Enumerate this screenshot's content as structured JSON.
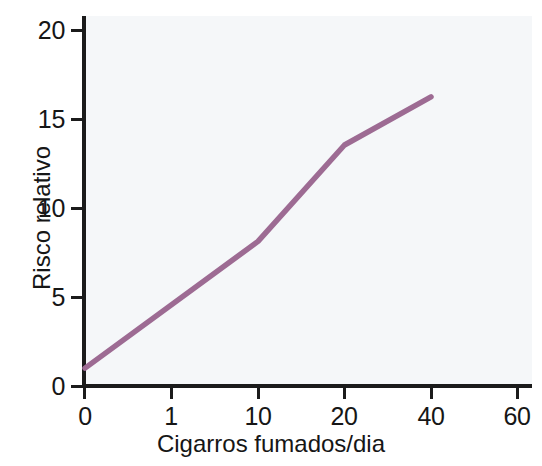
{
  "chart_data": {
    "type": "line",
    "title": "",
    "xlabel": "Cigarros fumados/dia",
    "ylabel": "Risco relativo",
    "x_tick_labels": [
      "0",
      "1",
      "10",
      "20",
      "40",
      "60"
    ],
    "y_tick_labels": [
      "0",
      "5",
      "10",
      "15",
      "20"
    ],
    "y_ticks": [
      0,
      5,
      10,
      15,
      20
    ],
    "ylim": [
      0,
      21.3
    ],
    "grid": false,
    "legend": null,
    "x_axis_scale": "categorical-evenly-spaced",
    "series": [
      {
        "name": "Risco relativo",
        "color": "#9d6b93",
        "x_categories": [
          "0",
          "10",
          "20",
          "40"
        ],
        "x_values": [
          0,
          10,
          20,
          40
        ],
        "values": [
          1.0,
          8.1,
          13.5,
          16.2
        ]
      }
    ],
    "points": [
      {
        "x_label": "0",
        "y": 1.0
      },
      {
        "x_label": "10",
        "y": 8.1
      },
      {
        "x_label": "20",
        "y": 13.5
      },
      {
        "x_label": "40",
        "y": 16.2
      }
    ]
  },
  "style": {
    "line_color": "#9d6b93",
    "axis_color": "#1b1b1b",
    "plot_background": "#f5f7f9",
    "page_background": "#ffffff",
    "text_color": "#161616"
  }
}
